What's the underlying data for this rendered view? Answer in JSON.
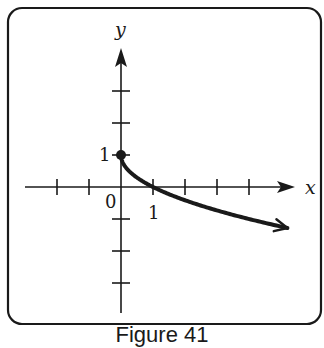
{
  "figure": {
    "caption": "Figure 41",
    "x_axis_label": "x",
    "y_axis_label": "y",
    "origin_label": "0",
    "x_tick_label": "1",
    "y_tick_label": "1"
  },
  "chart_data": {
    "type": "line",
    "title": "",
    "xlabel": "x",
    "ylabel": "y",
    "function": "y = 1 - sqrt(x)",
    "x": [
      0,
      0.25,
      1,
      2,
      3,
      4,
      5.2
    ],
    "y": [
      1,
      0.5,
      0,
      -0.41,
      -0.73,
      -1,
      -1.28
    ],
    "start_point": {
      "x": 0,
      "y": 1,
      "marker": "filled-dot"
    },
    "end": "arrow",
    "xlim": [
      -3,
      5.5
    ],
    "ylim": [
      -4,
      4.3
    ],
    "x_ticks": [
      -2,
      -1,
      1,
      2,
      3,
      4
    ],
    "y_ticks": [
      -3,
      -2,
      -1,
      1,
      2,
      3
    ],
    "labeled_ticks": {
      "x": [
        1
      ],
      "y": [
        1
      ]
    },
    "grid": false,
    "legend": "none"
  }
}
